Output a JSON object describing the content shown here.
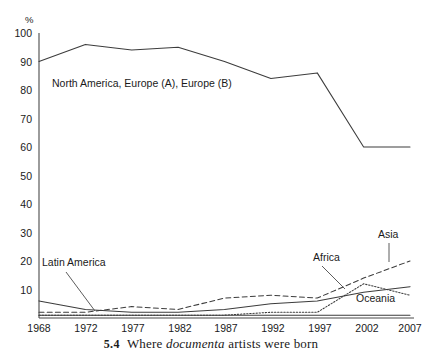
{
  "chart_data": {
    "type": "line",
    "title": "",
    "xlabel": "",
    "ylabel": "%",
    "categories": [
      "1968",
      "1972",
      "1977",
      "1982",
      "1987",
      "1992",
      "1997",
      "2002",
      "2007"
    ],
    "x": [
      1968,
      1972,
      1977,
      1982,
      1987,
      1992,
      1997,
      2002,
      2007
    ],
    "ylim": [
      0,
      100
    ],
    "xlim": [
      1968,
      2007
    ],
    "grid": false,
    "legend_position": "inline-annotations",
    "y_ticks": [
      0,
      10,
      20,
      30,
      40,
      50,
      60,
      70,
      80,
      90,
      100
    ],
    "y_tick_labels": [
      "",
      "10",
      "20",
      "30",
      "40",
      "50",
      "60",
      "70",
      "80",
      "90",
      "100"
    ],
    "series": [
      {
        "name": "North America, Europe (A), Europe (B)",
        "style": "solid",
        "values": [
          90,
          96,
          94,
          95,
          90,
          84,
          86,
          60,
          60
        ]
      },
      {
        "name": "Asia",
        "style": "dashed",
        "values": [
          2,
          2,
          4,
          3,
          7,
          8,
          7,
          14,
          20
        ]
      },
      {
        "name": "Africa",
        "style": "dotted",
        "values": [
          1,
          1,
          1,
          1,
          1,
          2,
          2,
          12,
          8
        ]
      },
      {
        "name": "Latin America",
        "style": "solid",
        "values": [
          6,
          3,
          2,
          2,
          3,
          5,
          6,
          9,
          11
        ]
      },
      {
        "name": "Oceania",
        "style": "solid",
        "values": [
          1,
          1,
          1,
          1,
          1,
          1,
          1,
          1,
          1
        ]
      }
    ],
    "annotations": [
      {
        "text": "North America, Europe (A), Europe (B)",
        "x": 52,
        "y": 87,
        "leader": false
      },
      {
        "text": "Latin America",
        "x": 42,
        "y": 266,
        "leader": true
      },
      {
        "text": "Africa",
        "x": 313,
        "y": 261,
        "leader": true
      },
      {
        "text": "Asia",
        "x": 378,
        "y": 238,
        "leader": true
      },
      {
        "text": "Oceania",
        "x": 356,
        "y": 302,
        "leader": false
      }
    ]
  },
  "caption": {
    "number": "5.4",
    "before_em": "Where ",
    "emphasis": "documenta",
    "after_em": " artists were born"
  },
  "axis": {
    "unit_label": "%",
    "y_labels": [
      "100",
      "90",
      "80",
      "70",
      "60",
      "50",
      "40",
      "30",
      "20",
      "10"
    ],
    "x_labels": [
      "1968",
      "1972",
      "1977",
      "1982",
      "1987",
      "1992",
      "1997",
      "2002",
      "2007"
    ]
  },
  "colors": {
    "line": "#3c3c3c",
    "axis": "#4a4a4a",
    "text": "#1a1a1a",
    "background": "#ffffff"
  }
}
